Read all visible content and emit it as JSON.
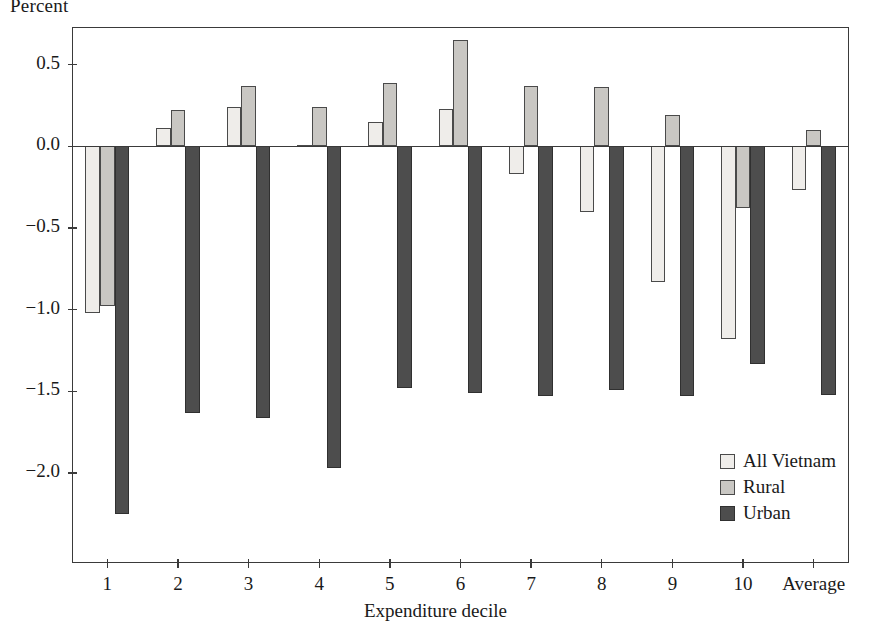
{
  "chart_data": {
    "type": "bar",
    "title": "",
    "ylabel": "Percent",
    "xlabel": "Expenditure decile",
    "categories": [
      "1",
      "2",
      "3",
      "4",
      "5",
      "6",
      "7",
      "8",
      "9",
      "10",
      "Average"
    ],
    "series": [
      {
        "name": "All Vietnam",
        "color": "#efedea",
        "values": [
          -1.02,
          0.11,
          0.24,
          0.01,
          0.15,
          0.23,
          -0.17,
          -0.4,
          -0.83,
          -1.18,
          -0.27
        ]
      },
      {
        "name": "Rural",
        "color": "#c9c7c3",
        "values": [
          -0.98,
          0.22,
          0.37,
          0.24,
          0.39,
          0.65,
          0.37,
          0.36,
          0.19,
          -0.38,
          0.1
        ]
      },
      {
        "name": "Urban",
        "color": "#4d4d4d",
        "values": [
          -2.25,
          -1.63,
          -1.66,
          -1.97,
          -1.48,
          -1.51,
          -1.53,
          -1.49,
          -1.53,
          -1.33,
          -1.52
        ]
      }
    ],
    "ylim": [
      -2.55,
      0.73
    ],
    "yticks": [
      0.5,
      0.0,
      -0.5,
      -1.0,
      -1.5,
      -2.0
    ],
    "ytick_labels": [
      "0.5",
      "0.0",
      "−0.5",
      "−1.0",
      "−1.5",
      "−2.0"
    ],
    "grid": false,
    "legend_position": "bottom-right",
    "legend_entries": [
      "All Vietnam",
      "Rural",
      "Urban"
    ]
  }
}
